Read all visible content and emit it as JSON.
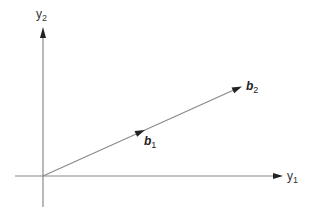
{
  "diagram": {
    "type": "vector-diagram",
    "axes": {
      "horizontal": {
        "label": "y",
        "subscript": "1"
      },
      "vertical": {
        "label": "y",
        "subscript": "2"
      }
    },
    "vectors": [
      {
        "name": "b",
        "subscript": "1"
      },
      {
        "name": "b",
        "subscript": "2"
      }
    ],
    "colors": {
      "line": "#8a8a8a",
      "arrow": "#222222",
      "text": "#333333"
    }
  }
}
